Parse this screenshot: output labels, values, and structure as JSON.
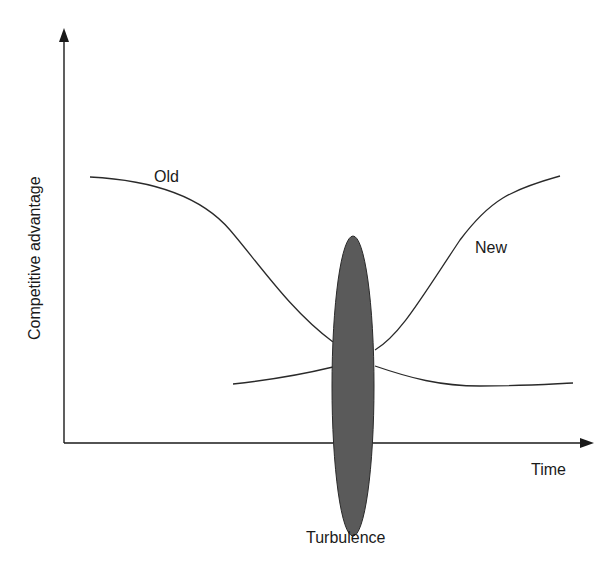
{
  "diagram": {
    "y_axis_label": "Competitive advantage",
    "x_axis_label": "Time",
    "curves": [
      {
        "name": "old",
        "label": "Old"
      },
      {
        "name": "new",
        "label": "New"
      }
    ],
    "region": {
      "name": "turbulence",
      "label": "Turbulence",
      "fill": "#5a5a5a"
    }
  }
}
